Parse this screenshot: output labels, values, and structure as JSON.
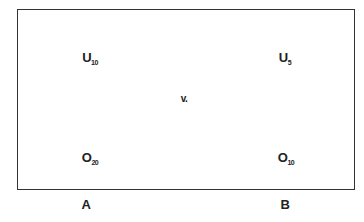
{
  "diagram": {
    "cells": {
      "top_left": {
        "main": "U",
        "sub": "10"
      },
      "top_right": {
        "main": "U",
        "sub": "5"
      },
      "bottom_left": {
        "main": "O",
        "sub": "20"
      },
      "bottom_right": {
        "main": "O",
        "sub": "10"
      }
    },
    "center_label": "v.",
    "columns": [
      "A",
      "B"
    ]
  }
}
